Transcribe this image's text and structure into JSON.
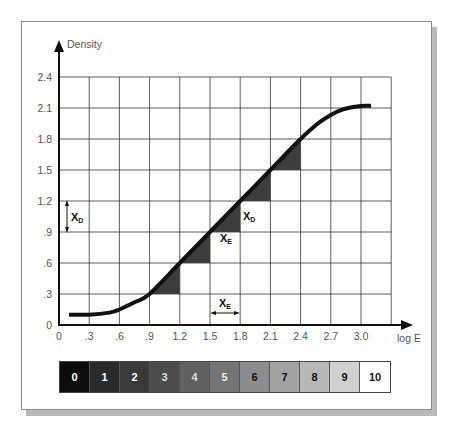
{
  "chart_data": {
    "type": "line",
    "ylabel": "Density",
    "xlabel": "log E",
    "x_ticks": [
      "0",
      ".3",
      ".6",
      ".9",
      "1.2",
      "1.5",
      "1.8",
      "2.1",
      "2.4",
      "2.7",
      "3.0"
    ],
    "y_ticks": [
      "0",
      ".3",
      ".6",
      ".9",
      "1.2",
      "1.5",
      "1.8",
      "2.1",
      "2.4"
    ],
    "xlim": [
      0,
      3.3
    ],
    "ylim": [
      0,
      2.4
    ],
    "grid": true,
    "series": [
      {
        "name": "H&D curve",
        "x": [
          0.1,
          0.3,
          0.5,
          0.6,
          0.75,
          0.9,
          1.2,
          1.5,
          1.8,
          2.1,
          2.4,
          2.6,
          2.8,
          3.0,
          3.1
        ],
        "y": [
          0.1,
          0.1,
          0.12,
          0.15,
          0.22,
          0.3,
          0.6,
          0.9,
          1.2,
          1.5,
          1.8,
          1.97,
          2.08,
          2.12,
          2.12
        ]
      }
    ],
    "shaded_triangles": [
      {
        "x0": 0.9,
        "x1": 1.2,
        "y0": 0.3,
        "y1": 0.6
      },
      {
        "x0": 1.2,
        "x1": 1.5,
        "y0": 0.6,
        "y1": 0.9
      },
      {
        "x0": 1.5,
        "x1": 1.8,
        "y0": 0.9,
        "y1": 1.2
      },
      {
        "x0": 1.8,
        "x1": 2.1,
        "y0": 1.2,
        "y1": 1.5
      },
      {
        "x0": 2.1,
        "x1": 2.4,
        "y0": 1.5,
        "y1": 1.8
      }
    ],
    "annotations": [
      {
        "text": "X",
        "subscript": "D",
        "at": "left of y-axis between 0.9 and 1.2, vertical double arrow"
      },
      {
        "text": "X",
        "subscript": "E",
        "at": "between x 1.5 and 1.8 near y 0.15, horizontal double arrow"
      },
      {
        "text": "X",
        "subscript": "E",
        "at": "below triangle at x 1.5-1.8, y ~0.9"
      },
      {
        "text": "X",
        "subscript": "D",
        "at": "right of triangle at x 1.8, y ~1.05"
      }
    ]
  },
  "axes": {
    "y_title": "Density",
    "x_title": "log E"
  },
  "gray_scale": {
    "steps": [
      {
        "label": "0",
        "bg": "#0c0c0c",
        "fg": "#ffffff"
      },
      {
        "label": "1",
        "bg": "#2a2a2a",
        "fg": "#ffffff"
      },
      {
        "label": "2",
        "bg": "#3a3a3a",
        "fg": "#ffffff"
      },
      {
        "label": "3",
        "bg": "#4c4c4c",
        "fg": "#dddddd"
      },
      {
        "label": "4",
        "bg": "#606060",
        "fg": "#dddddd"
      },
      {
        "label": "5",
        "bg": "#747474",
        "fg": "#eeeeee"
      },
      {
        "label": "6",
        "bg": "#8c8c8c",
        "fg": "#111111"
      },
      {
        "label": "7",
        "bg": "#a2a2a2",
        "fg": "#111111"
      },
      {
        "label": "8",
        "bg": "#b8b8b8",
        "fg": "#111111"
      },
      {
        "label": "9",
        "bg": "#d0d0d0",
        "fg": "#111111"
      },
      {
        "label": "10",
        "bg": "#ffffff",
        "fg": "#111111"
      }
    ]
  },
  "labels": {
    "xd": "X",
    "xd_sub": "D",
    "xe": "X",
    "xe_sub": "E"
  }
}
